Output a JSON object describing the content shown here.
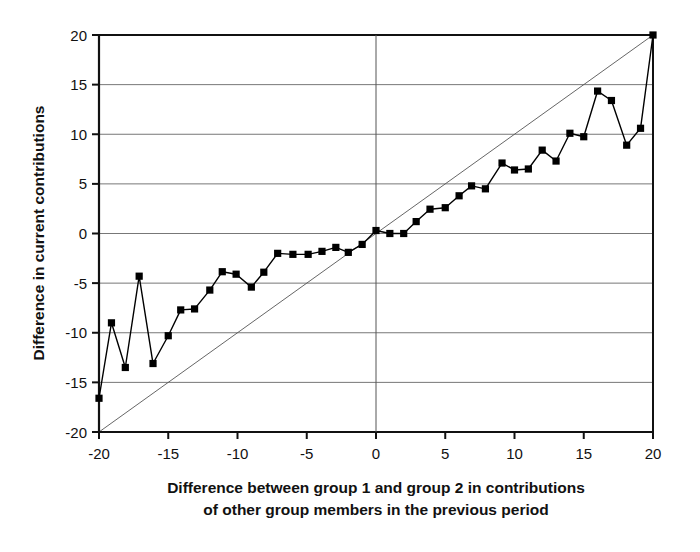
{
  "chart_data": {
    "type": "line",
    "title": "",
    "subtitle": "",
    "xlabel_line1": "Difference between group 1 and group 2 in contributions",
    "xlabel_line2": "of other group members in the previous period",
    "ylabel": "Difference in current contributions",
    "xlim": [
      -20,
      20
    ],
    "ylim": [
      -20,
      20
    ],
    "xticks": [
      -20,
      -15,
      -10,
      -5,
      0,
      5,
      10,
      15,
      20
    ],
    "yticks": [
      -20,
      -15,
      -10,
      -5,
      0,
      5,
      10,
      15,
      20
    ],
    "xtick_labels": [
      "-20",
      "-15",
      "-10",
      "-5",
      "0",
      "5",
      "10",
      "15",
      "20"
    ],
    "ytick_labels": [
      "-20",
      "-15",
      "-10",
      "-5",
      "0",
      "5",
      "10",
      "15",
      "20"
    ],
    "grid": "horizontal",
    "legend": "none",
    "series": [
      {
        "name": "Difference in current contributions",
        "marker": "square",
        "marker_color": "#000000",
        "line_color": "#000000",
        "line_width": 1.4,
        "x": [
          -20,
          -19.1,
          -18.1,
          -17.1,
          -16.1,
          -15.0,
          -14.1,
          -13.1,
          -12.0,
          -11.1,
          -10.1,
          -9.0,
          -8.1,
          -7.1,
          -6.0,
          -4.9,
          -3.9,
          -2.9,
          -2.0,
          -1.0,
          0,
          1.0,
          2.0,
          2.9,
          3.9,
          5.0,
          6.0,
          6.9,
          7.9,
          9.1,
          10.0,
          11.0,
          12.0,
          13.0,
          14.0,
          15.0,
          16.0,
          17.0,
          18.1,
          19.1,
          20
        ],
        "y": [
          -16.6,
          -9.0,
          -13.5,
          -4.3,
          -13.1,
          -10.3,
          -7.7,
          -7.6,
          -5.7,
          -3.85,
          -4.1,
          -5.4,
          -3.9,
          -2.0,
          -2.1,
          -2.1,
          -1.8,
          -1.4,
          -1.9,
          -1.1,
          0.3,
          0.0,
          0.0,
          1.2,
          2.45,
          2.6,
          3.8,
          4.8,
          4.5,
          7.1,
          6.4,
          6.5,
          8.4,
          7.3,
          10.1,
          9.75,
          14.35,
          13.4,
          8.9,
          10.6,
          20.0
        ]
      },
      {
        "name": "45-degree reference line",
        "marker": "none",
        "marker_color": "",
        "line_color": "#555555",
        "line_width": 0.9,
        "x": [
          -20,
          20
        ],
        "y": [
          -20,
          20
        ]
      }
    ]
  },
  "axes": {
    "x_tick_text": [
      "-20",
      "-15",
      "-10",
      "-5",
      "0",
      "5",
      "10",
      "15",
      "20"
    ],
    "y_tick_text": [
      "20",
      "15",
      "10",
      "5",
      "0",
      "-5",
      "-10",
      "-15",
      "-20"
    ]
  }
}
